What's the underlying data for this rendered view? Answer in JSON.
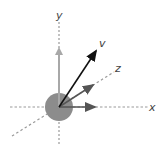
{
  "diagram": {
    "title": "",
    "origin": {
      "x": 59,
      "y": 107,
      "radius": 14,
      "color": "#8c8c8c"
    },
    "axes": [
      {
        "name": "x",
        "label": "x",
        "from": [
          10,
          107
        ],
        "to": [
          148,
          107
        ],
        "label_pos": [
          153,
          111
        ]
      },
      {
        "name": "y",
        "label": "y",
        "from": [
          59,
          22
        ],
        "to": [
          59,
          146
        ],
        "label_pos": [
          59,
          18
        ]
      },
      {
        "name": "z",
        "label": "z",
        "from": [
          12,
          136
        ],
        "to": [
          114,
          72
        ],
        "label_pos": [
          118,
          71
        ]
      }
    ],
    "vectors": [
      {
        "name": "y",
        "to": [
          59,
          47
        ],
        "color": "#a8a8a8"
      },
      {
        "name": "x",
        "to": [
          96,
          107
        ],
        "color": "#555555"
      },
      {
        "name": "z",
        "to": [
          94,
          84
        ],
        "color": "#555555"
      },
      {
        "name": "v",
        "label": "v",
        "to": [
          97,
          49
        ],
        "color": "#111111",
        "label_pos": [
          100,
          47
        ]
      }
    ],
    "axis_color": "#9a9a9a"
  }
}
